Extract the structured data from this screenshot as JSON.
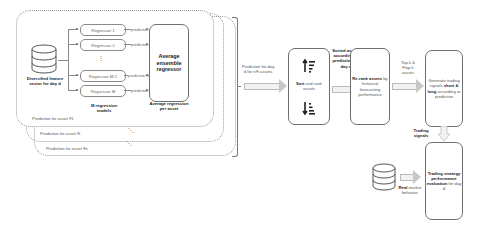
{
  "left_panel": {
    "database_label": "Diversified feature vector for day d",
    "regressors": [
      "Regressor 1",
      "Regressor 2",
      "Regressor M-1",
      "Regressor M"
    ],
    "predictions": [
      "prediction 1",
      "prediction 2",
      "prediction M-1",
      "prediction M"
    ],
    "models_caption": "M regression models",
    "ensemble_box": "Average ensemble regressor",
    "ensemble_caption": "Average regression per asset",
    "asset_layers": [
      "Prediction for asset §1",
      "Prediction for asset §i",
      "Prediction for asset §n"
    ],
    "vertical_dots": "⋮",
    "diag_dots": "⋱"
  },
  "flow": {
    "arrow1_label": "Prediction for day d for n§i assets",
    "sort_box": {
      "label_bold": "Sort",
      "label_rest": " and rank assets"
    },
    "arrow2_label": "Sorted assets according to prediction for day d",
    "rerank_box": {
      "label_bold": "Re-rank assets",
      "label_rest": " by historical forecasting performance"
    },
    "arrow3_label": "Top k & Flop k assets",
    "signals_box": {
      "line1": "Generate trading signals",
      "bold": "short & long",
      "line3": "according to prediction"
    },
    "arrow4_label": "Trading signals",
    "market_label_bold": "Real",
    "market_label_rest": " market behavior",
    "eval_box": {
      "bold": "Trading strategy performance evaluation",
      "rest": "for day d"
    }
  },
  "colors": {
    "line": "#8a8a8a",
    "arrow_fill": "#f2f2f2",
    "text": "#222222"
  }
}
